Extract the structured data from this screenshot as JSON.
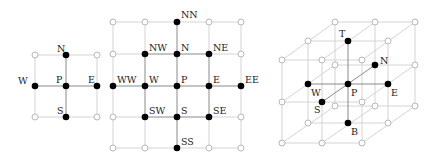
{
  "figures": [
    {
      "id": "stencil-2d-5point",
      "title": "",
      "nodes": [
        {
          "label": "N",
          "x": 66,
          "y": 55,
          "filled": true,
          "lx": 57,
          "ly": 52
        },
        {
          "label": "W",
          "x": 35,
          "y": 86,
          "filled": true,
          "lx": 19,
          "ly": 84
        },
        {
          "label": "P",
          "x": 66,
          "y": 86,
          "filled": true,
          "lx": 57,
          "ly": 82
        },
        {
          "label": "E",
          "x": 97,
          "y": 86,
          "filled": true,
          "lx": 88,
          "ly": 82
        },
        {
          "label": "S",
          "x": 66,
          "y": 117,
          "filled": true,
          "lx": 57,
          "ly": 113
        },
        {
          "label": "",
          "x": 35,
          "y": 55,
          "filled": false
        },
        {
          "label": "",
          "x": 97,
          "y": 55,
          "filled": false
        },
        {
          "label": "",
          "x": 35,
          "y": 117,
          "filled": false
        },
        {
          "label": "",
          "x": 97,
          "y": 117,
          "filled": false
        }
      ]
    },
    {
      "id": "stencil-2d-13point",
      "title": "",
      "nodes": [
        {
          "label": "NN",
          "x": 177,
          "y": 22,
          "filled": true
        },
        {
          "label": "NW",
          "x": 145,
          "y": 54,
          "filled": true
        },
        {
          "label": "N",
          "x": 177,
          "y": 54,
          "filled": true
        },
        {
          "label": "NE",
          "x": 209,
          "y": 54,
          "filled": true
        },
        {
          "label": "WW",
          "x": 113,
          "y": 86,
          "filled": true
        },
        {
          "label": "W",
          "x": 145,
          "y": 86,
          "filled": true
        },
        {
          "label": "P",
          "x": 177,
          "y": 86,
          "filled": true
        },
        {
          "label": "E",
          "x": 209,
          "y": 86,
          "filled": true
        },
        {
          "label": "EE",
          "x": 241,
          "y": 86,
          "filled": true
        },
        {
          "label": "SW",
          "x": 145,
          "y": 117,
          "filled": true
        },
        {
          "label": "S",
          "x": 177,
          "y": 117,
          "filled": true
        },
        {
          "label": "SE",
          "x": 209,
          "y": 117,
          "filled": true
        },
        {
          "label": "SS",
          "x": 177,
          "y": 148,
          "filled": true
        }
      ]
    },
    {
      "id": "stencil-3d-7point",
      "title": "",
      "nodes": [
        {
          "label": "T",
          "x": 348,
          "y": 41,
          "filled": true
        },
        {
          "label": "N",
          "x": 375,
          "y": 65,
          "filled": true
        },
        {
          "label": "W",
          "x": 308,
          "y": 84,
          "filled": true
        },
        {
          "label": "P",
          "x": 348,
          "y": 84,
          "filled": true
        },
        {
          "label": "E",
          "x": 388,
          "y": 84,
          "filled": true
        },
        {
          "label": "S",
          "x": 322,
          "y": 102,
          "filled": true
        },
        {
          "label": "B",
          "x": 348,
          "y": 123,
          "filled": true
        }
      ]
    }
  ],
  "labels": {
    "fig1": {
      "N": "N",
      "W": "W",
      "P": "P",
      "E": "E",
      "S": "S"
    },
    "fig2": {
      "NN": "NN",
      "NW": "NW",
      "N": "N",
      "NE": "NE",
      "WW": "WW",
      "W": "W",
      "P": "P",
      "E": "E",
      "EE": "EE",
      "SW": "SW",
      "S": "S",
      "SE": "SE",
      "SS": "SS"
    },
    "fig3": {
      "T": "T",
      "N": "N",
      "W": "W",
      "P": "P",
      "E": "E",
      "S": "S",
      "B": "B"
    }
  },
  "colors": {
    "filled_node": "#000000",
    "open_node_stroke": "#b8b8b8",
    "grid_line_light": "#d4d4d4",
    "stencil_line": "#8a8a8a"
  }
}
